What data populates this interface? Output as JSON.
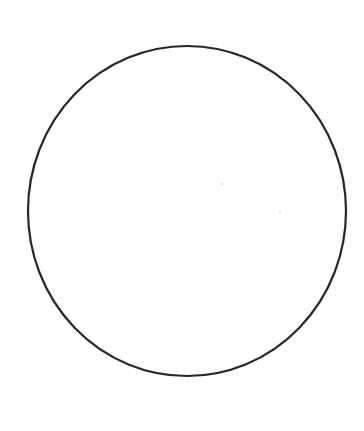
{
  "canvas": {
    "width": 364,
    "height": 431,
    "background": "#ffffff"
  },
  "shape": {
    "type": "circle",
    "cx": 187,
    "cy": 211,
    "rx": 159,
    "ry": 165,
    "stroke": "#2b2624",
    "stroke_width": 2.2,
    "fill": "none"
  },
  "artifacts": [
    {
      "cx": 222,
      "cy": 184,
      "r": 0.8,
      "color": "#b0b0b0"
    },
    {
      "cx": 280,
      "cy": 212,
      "r": 1.0,
      "color": "#d4d4d4"
    }
  ]
}
